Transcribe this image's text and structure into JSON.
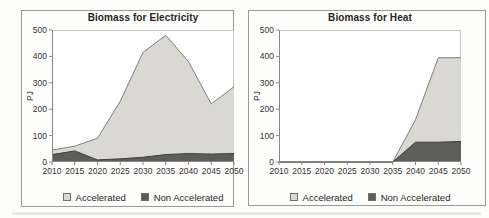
{
  "page": {
    "background": "#fdfdfc"
  },
  "style": {
    "plot_border": "#c6c5c0",
    "axis_color": "#878682",
    "tick_text_color": "#333333",
    "title_text_color": "#262626",
    "accelerated_fill": "#d9d8d2",
    "non_accelerated_fill": "#5d5d5b"
  },
  "chart_data": [
    {
      "type": "area",
      "mode": "overlapping-areas",
      "title": "Biomass for Electricity",
      "ylabel": "PJ",
      "xlabel": "",
      "categories": [
        2010,
        2015,
        2020,
        2025,
        2030,
        2035,
        2040,
        2045,
        2050
      ],
      "series": [
        {
          "name": "Accelerated",
          "values": [
            45,
            60,
            90,
            230,
            415,
            480,
            380,
            220,
            285
          ],
          "fill": "#d9d8d2",
          "stroke": "#7f7f7f"
        },
        {
          "name": "Non Accelerated",
          "values": [
            28,
            42,
            8,
            12,
            18,
            28,
            32,
            30,
            32
          ],
          "fill": "#5d5d5b",
          "stroke": "#3d3d3b"
        }
      ],
      "ylim": [
        0,
        500
      ],
      "y_ticks": [
        0,
        100,
        200,
        300,
        400,
        500
      ],
      "grid": false,
      "legend": [
        "Accelerated",
        "Non Accelerated"
      ],
      "legend_position": "bottom"
    },
    {
      "type": "area",
      "mode": "overlapping-areas",
      "title": "Biomass for Heat",
      "ylabel": "PJ",
      "xlabel": "",
      "categories": [
        2010,
        2015,
        2020,
        2025,
        2030,
        2035,
        2040,
        2045,
        2050
      ],
      "series": [
        {
          "name": "Accelerated",
          "values": [
            0,
            0,
            0,
            0,
            0,
            0,
            160,
            395,
            395
          ],
          "fill": "#d9d8d2",
          "stroke": "#7f7f7f"
        },
        {
          "name": "Non Accelerated",
          "values": [
            0,
            0,
            0,
            0,
            0,
            0,
            75,
            75,
            78
          ],
          "fill": "#5d5d5b",
          "stroke": "#3d3d3b"
        }
      ],
      "ylim": [
        0,
        500
      ],
      "y_ticks": [
        0,
        100,
        200,
        300,
        400,
        500
      ],
      "grid": false,
      "legend": [
        "Accelerated",
        "Non Accelerated"
      ],
      "legend_position": "bottom"
    }
  ]
}
